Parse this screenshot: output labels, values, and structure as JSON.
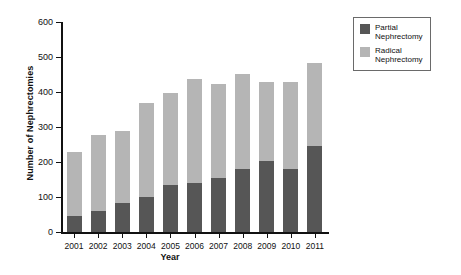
{
  "chart_data": {
    "type": "bar",
    "stacked": true,
    "title": "",
    "xlabel": "Year",
    "ylabel": "Number of Nephrectomies",
    "categories": [
      "2001",
      "2002",
      "2003",
      "2004",
      "2005",
      "2006",
      "2007",
      "2008",
      "2009",
      "2010",
      "2011"
    ],
    "series": [
      {
        "name": "Partial Nephrectomy",
        "legend_label": "Partial\nNephrectomy",
        "color": "#565656",
        "values": [
          47,
          59,
          82,
          100,
          133,
          140,
          154,
          179,
          203,
          179,
          246
        ]
      },
      {
        "name": "Radical Nephrectomy",
        "legend_label": "Radical\nNephrectomy",
        "color": "#b5b5b5",
        "values": [
          181,
          217,
          208,
          268,
          264,
          297,
          268,
          273,
          226,
          251,
          236
        ]
      }
    ],
    "totals": [
      228,
      276,
      290,
      368,
      397,
      437,
      422,
      452,
      429,
      430,
      482
    ],
    "ylim": [
      0,
      600
    ],
    "yticks": [
      0,
      100,
      200,
      300,
      400,
      500,
      600
    ],
    "ytick_labels": [
      "0",
      "100",
      "200",
      "300",
      "400",
      "500",
      "600"
    ],
    "grid": false,
    "legend_position": "top-right",
    "axis_color": "#111111",
    "background": "#ffffff"
  }
}
